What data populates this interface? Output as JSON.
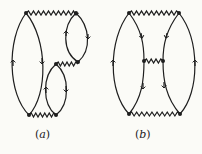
{
  "figure": {
    "type": "feynman-diagrams",
    "panels": [
      {
        "id": "a",
        "label": "(a)",
        "label_letter": "a",
        "description": "Two vertex-pairs joined by fermion loops and wavy interaction lines (non-ladder / exchange-type topology)"
      },
      {
        "id": "b",
        "label": "(b)",
        "label_letter": "b",
        "description": "Two fermion loops connected by three wavy interaction lines (top, middle, bottom)"
      }
    ],
    "colors": {
      "line": "#1e1e1e",
      "background": "#fbfbf7"
    }
  }
}
